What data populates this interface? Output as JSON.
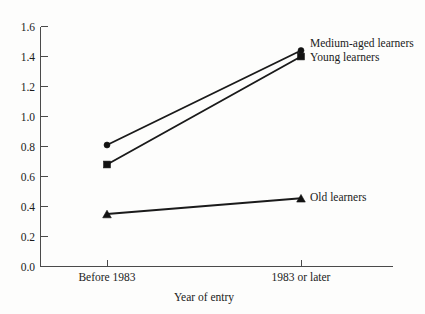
{
  "chart_data": {
    "type": "line",
    "title": "",
    "subtitle": "",
    "xlabel": "Year of entry",
    "ylabel": "",
    "categories": [
      "Before 1983",
      "1983 or later"
    ],
    "x": [
      0,
      1
    ],
    "xlim": [
      -0.35,
      1.45
    ],
    "ylim": [
      0.0,
      1.6
    ],
    "grid": false,
    "legend_position": "inline-right-of-endpoints",
    "y_ticks": [
      "0.0",
      "0.2",
      "0.4",
      "0.6",
      "0.8",
      "1.0",
      "1.2",
      "1.4",
      "1.6"
    ],
    "y_tick_values": [
      0.0,
      0.2,
      0.4,
      0.6,
      0.8,
      1.0,
      1.2,
      1.4,
      1.6
    ],
    "x_ticks": [
      "Before 1983",
      "1983 or later"
    ],
    "series": [
      {
        "name": "Medium-aged learners",
        "marker": "circle",
        "values": [
          0.81,
          1.44
        ],
        "label": "Medium-aged learners"
      },
      {
        "name": "Young learners",
        "marker": "square",
        "values": [
          0.68,
          1.4
        ],
        "label": "Young learners"
      },
      {
        "name": "Old learners",
        "marker": "triangle",
        "values": [
          0.35,
          0.455
        ],
        "label": "Old learners"
      }
    ],
    "annotations": [],
    "colors": {
      "line": "#1a1a1a",
      "marker": "#121212",
      "axis": "#4a4a4a",
      "text": "#1b1b1b",
      "background": "#fdfdfc"
    }
  },
  "axis": {
    "x_title": "Year of entry",
    "y_tick_labels": [
      "1.6",
      "1.4",
      "1.2",
      "1.0",
      "0.8",
      "0.6",
      "0.4",
      "0.2",
      "0.0"
    ],
    "x_tick_labels": [
      "Before 1983",
      "1983 or later"
    ]
  },
  "labels": {
    "medium": "Medium-aged learners",
    "young": "Young learners",
    "old": "Old learners"
  }
}
